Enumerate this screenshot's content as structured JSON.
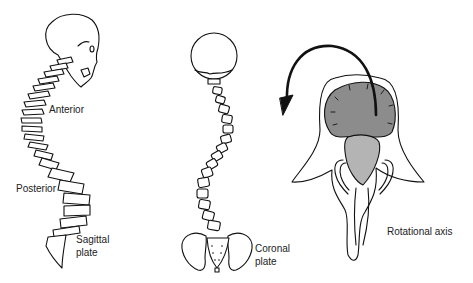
{
  "figure": {
    "panels": [
      {
        "id": "sagittal",
        "labels": {
          "anterior": "Anterior",
          "posterior": "Posterior",
          "plane_line1": "Sagittal",
          "plane_line2": "plate"
        }
      },
      {
        "id": "coronal",
        "labels": {
          "plane_line1": "Coronal",
          "plane_line2": "plate"
        }
      },
      {
        "id": "rotational",
        "labels": {
          "axis": "Rotational axis"
        }
      }
    ],
    "colors": {
      "line": "#111111",
      "vertebral_body_fill": "#8c8c8c",
      "canal_fill": "#b4b4b4",
      "background": "#ffffff"
    }
  }
}
